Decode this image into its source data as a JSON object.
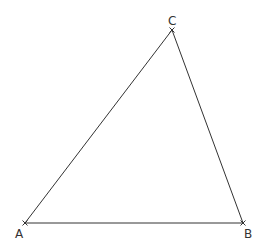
{
  "diagram": {
    "type": "triangle",
    "vertices": [
      {
        "label": "A",
        "x": 25,
        "y": 223,
        "label_x": 15,
        "label_y": 238
      },
      {
        "label": "B",
        "x": 243,
        "y": 223,
        "label_x": 244,
        "label_y": 238
      },
      {
        "label": "C",
        "x": 172,
        "y": 30,
        "label_x": 168,
        "label_y": 25
      }
    ],
    "edges": [
      [
        "A",
        "B"
      ],
      [
        "B",
        "C"
      ],
      [
        "C",
        "A"
      ]
    ],
    "colors": {
      "line": "#333333",
      "label": "#333333",
      "background": "#ffffff"
    }
  }
}
